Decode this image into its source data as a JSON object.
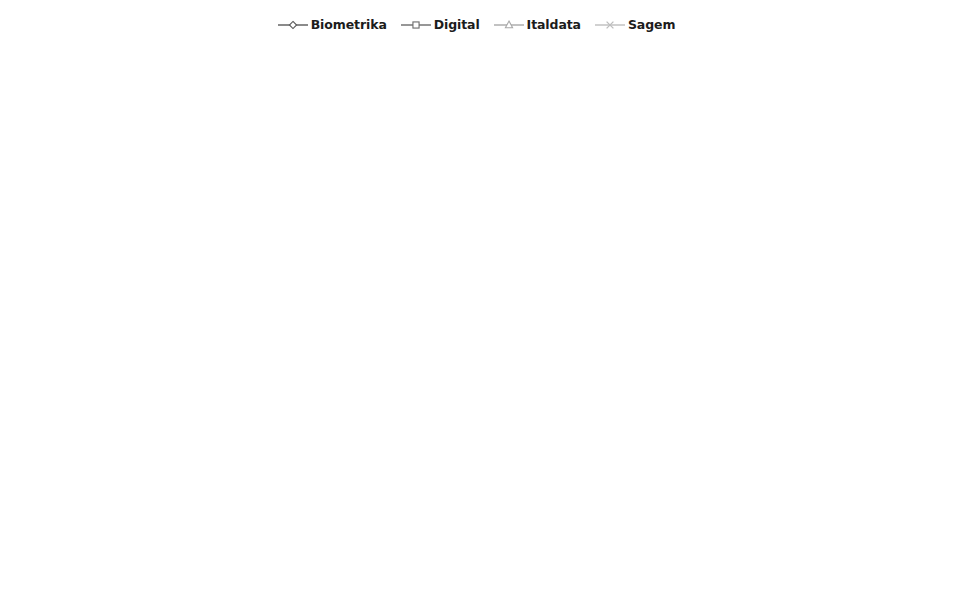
{
  "legend": {
    "position": "top-center",
    "entries": [
      {
        "label": "Biometrika",
        "marker": "diamond",
        "color": "#5a5a5a",
        "icon": "diamond-marker-icon"
      },
      {
        "label": "Digital",
        "marker": "square",
        "color": "#6b6b6b",
        "icon": "square-marker-icon"
      },
      {
        "label": "Italdata",
        "marker": "triangle",
        "color": "#a8a8a8",
        "icon": "triangle-marker-icon"
      },
      {
        "label": "Sagem",
        "marker": "x",
        "color": "#bdbdbd",
        "icon": "x-marker-icon"
      }
    ]
  },
  "axes": {
    "xlabel": "SCALE(σ)",
    "ylabel": "ACE(%)",
    "xticks": [
      "1",
      "1.4",
      "1.96",
      "2.74",
      "3.84"
    ],
    "yticks": [
      "0",
      "5",
      "10",
      "15",
      "20",
      "25",
      "30"
    ],
    "ylim": [
      0,
      30
    ],
    "grid": false
  },
  "chart_data": [
    {
      "type": "line",
      "id": "panel-a",
      "title": "a) K = 256",
      "xlabel": "SCALE(σ)",
      "ylabel": "ACE(%)",
      "categories": [
        "1",
        "1.4",
        "1.96",
        "2.74",
        "3.84"
      ],
      "ylim": [
        0,
        30
      ],
      "series": [
        {
          "name": "Biometrika",
          "values": [
            9.8,
            8.9,
            9.3,
            10.0,
            9.6
          ]
        },
        {
          "name": "Digital",
          "values": [
            2.8,
            3.2,
            2.4,
            2.0,
            2.5
          ]
        },
        {
          "name": "Italdata",
          "values": [
            26.8,
            23.5,
            20.0,
            21.6,
            18.0
          ]
        },
        {
          "name": "Sagem",
          "values": [
            6.6,
            4.8,
            4.8,
            4.8,
            4.6
          ]
        }
      ]
    },
    {
      "type": "line",
      "id": "panel-b",
      "title": "b) K = 512",
      "xlabel": "SCALE(σ)",
      "ylabel": "ACE(%)",
      "categories": [
        "1",
        "1.4",
        "1.96",
        "2.74",
        "3.84"
      ],
      "ylim": [
        0,
        30
      ],
      "series": [
        {
          "name": "Biometrika",
          "values": [
            8.9,
            6.5,
            6.4,
            8.2,
            7.7
          ]
        },
        {
          "name": "Digital",
          "values": [
            2.3,
            2.0,
            2.1,
            2.1,
            2.3
          ]
        },
        {
          "name": "Italdata",
          "values": [
            21.5,
            22.6,
            20.7,
            27.3,
            18.2
          ]
        },
        {
          "name": "Sagem",
          "values": [
            4.6,
            4.3,
            4.1,
            4.1,
            4.3
          ]
        }
      ]
    },
    {
      "type": "line",
      "id": "panel-c",
      "title": "c) K = 1024",
      "xlabel": "SCALE(σ)",
      "ylabel": "ACE(%)",
      "categories": [
        "1",
        "1.4",
        "1.96",
        "2.74",
        "3.84"
      ],
      "ylim": [
        0,
        30
      ],
      "series": [
        {
          "name": "Biometrika",
          "values": [
            6.9,
            6.0,
            5.5,
            5.5,
            5.8
          ]
        },
        {
          "name": "Digital",
          "values": [
            1.6,
            2.1,
            1.4,
            1.3,
            1.6
          ]
        },
        {
          "name": "Italdata",
          "values": [
            19.2,
            15.8,
            17.8,
            13.9,
            24.4
          ]
        },
        {
          "name": "Sagem",
          "values": [
            4.3,
            3.2,
            3.7,
            3.4,
            3.3
          ]
        }
      ]
    },
    {
      "type": "line",
      "id": "panel-d",
      "title": "d) K = 2048",
      "xlabel": "SCALE(σ)",
      "ylabel": "ACE(%)",
      "categories": [
        "1",
        "1.4",
        "1.96",
        "2.74",
        "3.84"
      ],
      "ylim": [
        0,
        30
      ],
      "series": [
        {
          "name": "Biometrika",
          "values": [
            8.1,
            6.2,
            7.3,
            6.6,
            7.0
          ]
        },
        {
          "name": "Digital",
          "values": [
            3.0,
            3.1,
            3.3,
            2.7,
            3.0
          ]
        },
        {
          "name": "Italdata",
          "values": [
            11.1,
            14.5,
            12.9,
            12.4,
            11.6
          ]
        },
        {
          "name": "Sagem",
          "values": [
            4.3,
            4.0,
            3.4,
            5.1,
            5.0
          ]
        }
      ]
    },
    {
      "type": "line",
      "id": "panel-e",
      "title": "e) K = 4096",
      "xlabel": "SCALE(σ)",
      "ylabel": "ACE(%)",
      "categories": [
        "1",
        "1.4",
        "1.96",
        "2.74",
        "3.84"
      ],
      "ylim": [
        0,
        30
      ],
      "series": [
        {
          "name": "Biometrika",
          "values": [
            11.1,
            10.1,
            8.5,
            8.4,
            6.7
          ]
        },
        {
          "name": "Digital",
          "values": [
            4.0,
            4.4,
            3.3,
            2.7,
            3.1
          ]
        },
        {
          "name": "Italdata",
          "values": [
            14.1,
            9.3,
            8.5,
            14.2,
            16.5
          ]
        },
        {
          "name": "Sagem",
          "values": [
            7.2,
            7.6,
            6.1,
            5.0,
            4.9
          ]
        }
      ]
    },
    {
      "type": "line",
      "id": "panel-f",
      "title": "f) K = 8192",
      "xlabel": "SCALE(σ)",
      "ylabel": "ACE(%)",
      "categories": [
        "1",
        "1.4",
        "1.96",
        "2.74",
        "3.84"
      ],
      "ylim": [
        0,
        30
      ],
      "series": [
        {
          "name": "Biometrika",
          "values": [
            6.6,
            5.4,
            7.4,
            7.4,
            6.6
          ]
        },
        {
          "name": "Digital",
          "values": [
            1.3,
            2.5,
            3.6,
            2.3,
            2.4
          ]
        },
        {
          "name": "Italdata",
          "values": [
            13.5,
            6.4,
            12.7,
            10.8,
            12.8
          ]
        },
        {
          "name": "Sagem",
          "values": [
            3.9,
            4.2,
            4.8,
            5.2,
            4.3
          ]
        }
      ]
    }
  ]
}
